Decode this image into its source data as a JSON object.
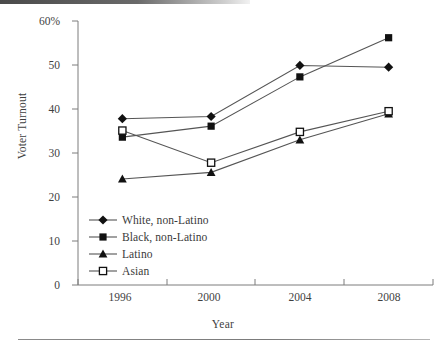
{
  "chart_data": {
    "type": "line",
    "title": "",
    "xlabel": "Year",
    "ylabel": "Voter Turnout",
    "categories": [
      "1996",
      "2000",
      "2004",
      "2008"
    ],
    "ylim": [
      0,
      60
    ],
    "ytick_labels": [
      "0",
      "10",
      "20",
      "30",
      "40",
      "50",
      "60%"
    ],
    "ytick_values": [
      0,
      10,
      20,
      30,
      40,
      50,
      60
    ],
    "grid": false,
    "legend_position": "lower-left-inside",
    "series": [
      {
        "name": "White, non-Latino",
        "marker": "filled-diamond",
        "values": [
          37.8,
          38.3,
          49.9,
          49.5
        ]
      },
      {
        "name": "Black, non-Latino",
        "marker": "filled-square",
        "values": [
          33.6,
          36.1,
          47.3,
          56.2
        ]
      },
      {
        "name": "Latino",
        "marker": "filled-triangle",
        "values": [
          24.1,
          25.6,
          33.0,
          38.9
        ]
      },
      {
        "name": "Asian",
        "marker": "open-square",
        "values": [
          35.1,
          27.8,
          34.8,
          39.5
        ]
      }
    ]
  },
  "axis": {
    "ylabel": "Voter Turnout",
    "xlabel": "Year",
    "yticks": [
      "60%",
      "50",
      "40",
      "30",
      "20",
      "10",
      "0"
    ],
    "xticks": [
      "1996",
      "2000",
      "2004",
      "2008"
    ]
  },
  "legend": {
    "items": [
      {
        "label": "White, non-Latino",
        "marker": "filled-diamond"
      },
      {
        "label": "Black, non-Latino",
        "marker": "filled-square"
      },
      {
        "label": "Latino",
        "marker": "filled-triangle"
      },
      {
        "label": "Asian",
        "marker": "open-square"
      }
    ]
  },
  "colors": {
    "line": "#555555",
    "marker": "#111111",
    "axis": "#6e6e6e",
    "text": "#3a3a3a",
    "background": "#ffffff"
  }
}
